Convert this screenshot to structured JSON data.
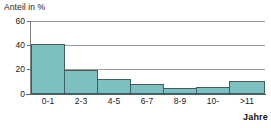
{
  "chart_data": {
    "type": "bar",
    "title": "",
    "subtitle": "",
    "xlabel": "Jahre",
    "ylabel": "Anteil in %",
    "categories": [
      "0-1",
      "2-3",
      "4-5",
      "6-7",
      "8-9",
      "10-",
      ">11"
    ],
    "values": [
      41,
      20,
      12,
      8.5,
      5,
      5.5,
      11
    ],
    "ylim": [
      0,
      60
    ],
    "yticks": [
      0,
      20,
      40,
      60
    ],
    "ytick_labels": [
      "0",
      "20",
      "40",
      "60"
    ],
    "grid": "horizontal",
    "legend": "none",
    "bar_style": "contiguous-histogram",
    "colors": {
      "bar_fill": "#7dc0c0",
      "bar_border": "#3c5f63",
      "gridline": "#9a9a9a",
      "axis": "#5a5a5a",
      "text": "#1a1a1a",
      "background": "#ffffff"
    }
  }
}
